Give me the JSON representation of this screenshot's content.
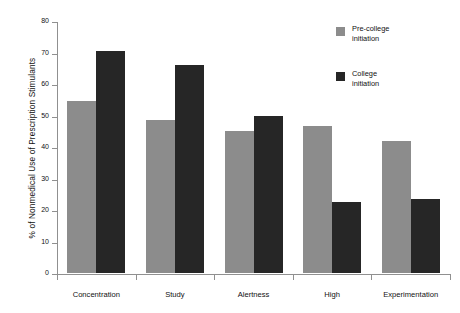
{
  "chart_data": {
    "type": "bar",
    "title": "",
    "xlabel": "",
    "ylabel": "% of Nonmedical Use of Prescription Stimulants",
    "ylim": [
      0,
      80
    ],
    "yticks": [
      0,
      10,
      20,
      30,
      40,
      50,
      60,
      70,
      80
    ],
    "ytick_labels": [
      "0",
      "10",
      "20",
      "30",
      "40",
      "50",
      "60",
      "70",
      "80"
    ],
    "grid": false,
    "legend_position": "top-right",
    "categories": [
      "Concentration",
      "Study",
      "Alertness",
      "High",
      "Experimentation"
    ],
    "series": [
      {
        "name": "Pre-college initiation",
        "color": "#8c8c8c",
        "values": [
          54.7,
          48.7,
          45.0,
          46.8,
          42.0
        ]
      },
      {
        "name": "College initiation",
        "color": "#262626",
        "values": [
          70.5,
          66.0,
          49.7,
          22.5,
          23.6
        ]
      }
    ]
  },
  "legend": {
    "entries": [
      {
        "line1": "Pre-college",
        "line2": "initiation",
        "color": "#8c8c8c",
        "swatch_name": "pre-college-swatch"
      },
      {
        "line1": "College",
        "line2": "initiation",
        "color": "#262626",
        "swatch_name": "college-swatch"
      }
    ]
  },
  "axes": {
    "y_title": "% of Nonmedical Use of Prescription Stimulants"
  },
  "colors": {
    "series_pre_college": "#8c8c8c",
    "series_college": "#262626",
    "axis": "#909090",
    "text": "#111111",
    "background": "#ffffff"
  }
}
